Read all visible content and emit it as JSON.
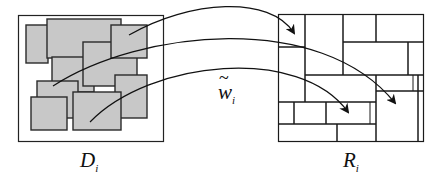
{
  "diagram": {
    "domain_label": {
      "base": "D",
      "sub": "i"
    },
    "range_label": {
      "base": "R",
      "sub": "i"
    },
    "map_label": {
      "tilde": "~",
      "base": "w",
      "sub": "i"
    },
    "colors": {
      "stroke": "#1a1a1a",
      "fill": "#c8c8c8",
      "background": "#ffffff"
    },
    "domain_blocks": 9,
    "arrows": 3
  }
}
